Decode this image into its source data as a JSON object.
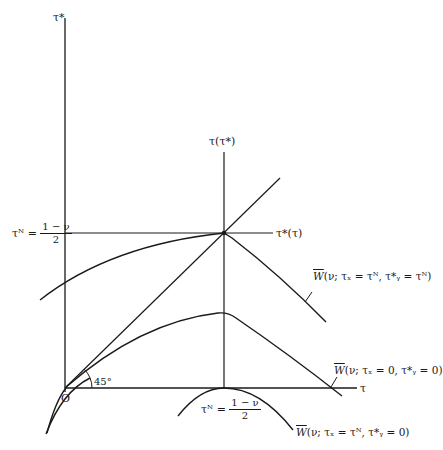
{
  "diagram": {
    "type": "economic-diagram",
    "axes": {
      "vertical_label": "τ*",
      "horizontal_label": "τ",
      "origin_label": "O",
      "angle_label": "45°"
    },
    "reaction_axes": {
      "vertical_label": "τ(τ*)",
      "horizontal_label": "τ*(τ)"
    },
    "nash_vertical": {
      "lhs": "τᴺ =",
      "numerator": "1 − ν",
      "denominator": "2"
    },
    "nash_horizontal": {
      "lhs": "τᴺ =",
      "numerator": "1 − ν",
      "denominator": "2"
    },
    "curves": [
      {
        "id": "upper",
        "W": "W",
        "label": "(ν; τₓ = τᴺ, τ*ᵧ = τᴺ)"
      },
      {
        "id": "middle",
        "W": "W",
        "label": "(ν; τₓ = 0, τ*ᵧ = 0)"
      },
      {
        "id": "lower",
        "W": "W",
        "label": "(ν; τₓ = τᴺ, τ*ᵧ = 0)"
      }
    ],
    "colors": {
      "ink": "#1a1a1a",
      "background": "#ffffff"
    }
  }
}
